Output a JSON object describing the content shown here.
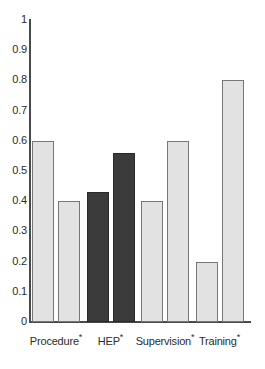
{
  "chart_data": {
    "type": "bar",
    "title": "",
    "subtitle": "",
    "xlabel": "",
    "ylabel": "",
    "ylim": [
      0,
      1
    ],
    "xlim": null,
    "grid": false,
    "legend": null,
    "legend_position": "none",
    "categories": [
      "Procedure",
      "HEP",
      "Supervision",
      "Training"
    ],
    "category_marker": "*",
    "category_labels": [
      "Procedure*",
      "HEP*",
      "Supervision*",
      "Training*"
    ],
    "ytick_labels": [
      "1",
      "0.9",
      "0.8",
      "0.7",
      "0.6",
      "0.5",
      "0.4",
      "0.3",
      "0.2",
      "0.1",
      "0"
    ],
    "ytick_values": [
      1,
      0.9,
      0.8,
      0.7,
      0.6,
      0.5,
      0.4,
      0.3,
      0.2,
      0.1,
      0
    ],
    "series": [
      {
        "name": "bar-1",
        "values": [
          0.6,
          0.43,
          0.4,
          0.2
        ],
        "colors": [
          "#e2e2e2",
          "#3b3b3b",
          "#e2e2e2",
          "#e2e2e2"
        ]
      },
      {
        "name": "bar-2",
        "values": [
          0.4,
          0.56,
          0.6,
          0.8
        ],
        "colors": [
          "#e2e2e2",
          "#3b3b3b",
          "#e2e2e2",
          "#e2e2e2"
        ]
      }
    ],
    "bars": [
      {
        "group": "Procedure",
        "index": 0,
        "value": 0.6,
        "fill": "#e2e2e2",
        "style": "light"
      },
      {
        "group": "Procedure",
        "index": 1,
        "value": 0.4,
        "fill": "#e2e2e2",
        "style": "light"
      },
      {
        "group": "HEP",
        "index": 0,
        "value": 0.43,
        "fill": "#3b3b3b",
        "style": "dark"
      },
      {
        "group": "HEP",
        "index": 1,
        "value": 0.56,
        "fill": "#3b3b3b",
        "style": "dark"
      },
      {
        "group": "Supervision",
        "index": 0,
        "value": 0.4,
        "fill": "#e2e2e2",
        "style": "light"
      },
      {
        "group": "Supervision",
        "index": 1,
        "value": 0.6,
        "fill": "#e2e2e2",
        "style": "light"
      },
      {
        "group": "Training",
        "index": 0,
        "value": 0.2,
        "fill": "#e2e2e2",
        "style": "light"
      },
      {
        "group": "Training",
        "index": 1,
        "value": 0.8,
        "fill": "#e2e2e2",
        "style": "light"
      }
    ],
    "colors": {
      "light_bar": "#e2e2e2",
      "dark_bar": "#3b3b3b",
      "bar_border": "#6e6e6e",
      "axis": "#4a4a4a",
      "text": "#2b2b2b",
      "background": "#ffffff"
    }
  }
}
